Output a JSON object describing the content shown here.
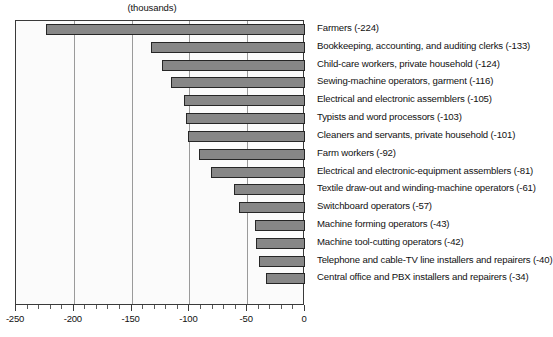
{
  "chart": {
    "title_fragment": "Occupations with the largest job decline",
    "units_caption": "(thousands)",
    "axis_labels": [
      "-250",
      "-200",
      "-150",
      "-100",
      "-50",
      "0"
    ],
    "colors": {
      "bar_fill": "#878787",
      "bar_border": "#262626",
      "frame": "#3a3a3a",
      "gridline": "#9a9a9a",
      "plot_background": "#fbfbfb",
      "text": "#111111"
    }
  },
  "chart_data": {
    "type": "bar",
    "orientation": "horizontal",
    "title": "(thousands)",
    "xlabel": "",
    "ylabel": "",
    "xlim": [
      -250,
      0
    ],
    "grid": true,
    "legend": false,
    "xticks": [
      -250,
      -200,
      -150,
      -100,
      -50,
      0
    ],
    "minor_tick_step": 10,
    "categories": [
      "Farmers",
      "Bookkeeping, accounting, and auditing clerks",
      "Child-care workers, private household",
      "Sewing-machine operators, garment",
      "Electrical and electronic assemblers",
      "Typists and word processors",
      "Cleaners and servants, private household",
      "Farm workers",
      "Electrical and electronic-equipment assemblers",
      "Textile draw-out and winding-machine operators",
      "Switchboard operators",
      "Machine forming operators",
      "Machine tool-cutting operators",
      "Telephone and cable-TV line installers and repairers",
      "Central office and PBX installers and repairers"
    ],
    "values": [
      -224,
      -133,
      -124,
      -116,
      -105,
      -103,
      -101,
      -92,
      -81,
      -61,
      -57,
      -43,
      -42,
      -40,
      -34
    ],
    "labels": [
      "Farmers (-224)",
      "Bookkeeping, accounting, and auditing clerks (-133)",
      "Child-care workers, private household  (-124)",
      "Sewing-machine operators, garment (-116)",
      "Electrical and electronic assemblers (-105)",
      "Typists and word processors (-103)",
      "Cleaners and servants, private household (-101)",
      "Farm workers (-92)",
      "Electrical and electronic-equipment assemblers (-81)",
      "Textile draw-out and winding-machine operators (-61)",
      "Switchboard operators (-57)",
      "Machine forming operators (-43)",
      "Machine tool-cutting operators (-42)",
      "Telephone and cable-TV line installers and repairers (-40)",
      "Central office and PBX installers and repairers (-34)"
    ]
  }
}
